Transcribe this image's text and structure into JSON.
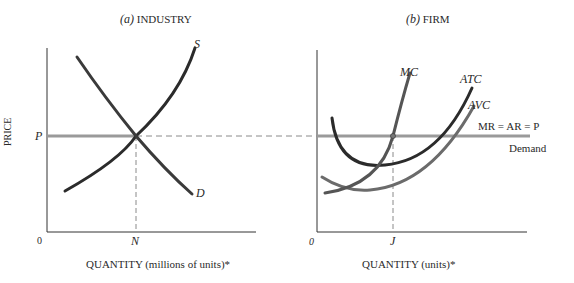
{
  "panels": {
    "industry": {
      "title_prefix": "(a)",
      "title": "INDUSTRY",
      "y_axis_label": "PRICE",
      "x_axis_label": "QUANTITY (millions of units)*",
      "origin": "0",
      "price_label": "P",
      "quantity_label": "N",
      "supply_label": "S",
      "demand_label": "D"
    },
    "firm": {
      "title_prefix": "(b)",
      "title": "FIRM",
      "x_axis_label": "QUANTITY (units)*",
      "origin": "0",
      "quantity_label": "J",
      "mc_label": "MC",
      "atc_label": "ATC",
      "avc_label": "AVC",
      "price_line_label": "MR = AR = P",
      "demand_label": "Demand"
    }
  },
  "colors": {
    "axis": "#333333",
    "curve_dark": "#2b2b2b",
    "curve_gray": "#6b6b6b",
    "price_line": "#9a9a9a",
    "dashed": "#8a8a8a"
  }
}
